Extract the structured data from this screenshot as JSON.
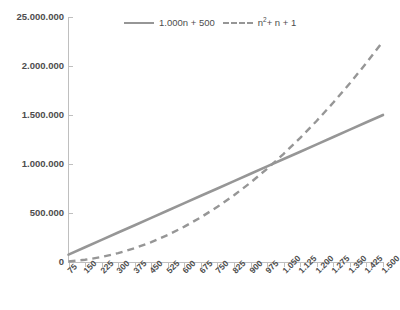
{
  "chart_data": {
    "type": "line",
    "title": "",
    "subtitle": "",
    "xlabel": "",
    "ylabel": "",
    "grid": false,
    "legend_position": "top-center",
    "x": [
      75,
      150,
      225,
      300,
      375,
      450,
      525,
      600,
      675,
      750,
      825,
      900,
      975,
      1050,
      1125,
      1200,
      1275,
      1350,
      1425,
      1500
    ],
    "xtick_labels": [
      "75",
      "150",
      "225",
      "300",
      "375",
      "450",
      "525",
      "600",
      "675",
      "750",
      "825",
      "900",
      "975",
      "1.050",
      "1.125",
      "1.200",
      "1.275",
      "1.350",
      "1.425",
      "1.500"
    ],
    "xlim": [
      75,
      1500
    ],
    "ylim": [
      0,
      2500000
    ],
    "ytick_values": [
      0,
      500000,
      1000000,
      1500000,
      2000000,
      2500000
    ],
    "ytick_labels": [
      "0",
      "500.000",
      "1.000.000",
      "1.500.000",
      "2.000.000",
      "25.000.000"
    ],
    "series": [
      {
        "name": "1.000n + 500",
        "style": "solid",
        "color": "#969696",
        "values": [
          75500,
          150500,
          225500,
          300500,
          375500,
          450500,
          525500,
          600500,
          675500,
          750500,
          825500,
          900500,
          975500,
          1050500,
          1125500,
          1200500,
          1275500,
          1350500,
          1425500,
          1500500
        ]
      },
      {
        "name": "n² + n + 1",
        "style": "dashed",
        "color": "#969696",
        "values": [
          5701,
          22651,
          50851,
          90301,
          141001,
          202951,
          276151,
          360601,
          456301,
          563251,
          681451,
          810901,
          951601,
          1103551,
          1266751,
          1441201,
          1626901,
          1823851,
          2032051,
          2251501
        ]
      }
    ]
  },
  "legend": {
    "entries": [
      {
        "label": "1.000n + 500",
        "style": "solid"
      },
      {
        "label": "n",
        "sup": "2",
        "rest": "+ n + 1",
        "style": "dashed"
      }
    ]
  }
}
